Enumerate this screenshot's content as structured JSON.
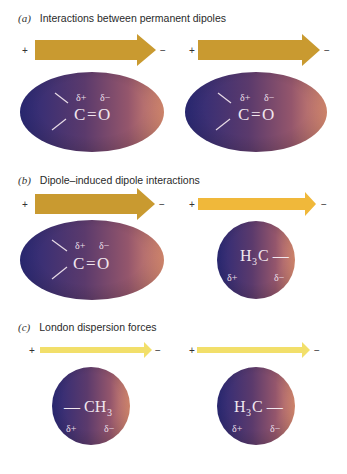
{
  "panels": [
    {
      "tag": "(a)",
      "title": "Interactions between permanent dipoles",
      "left": {
        "arrow": {
          "plus": "+",
          "minus": "−",
          "color": "#c99a30",
          "size": "large"
        },
        "molecule": {
          "shape": "ellipse",
          "formula_left": "C",
          "bond": "=",
          "formula_right": "O",
          "delta_plus": "δ+",
          "delta_minus": "δ−"
        }
      },
      "right": {
        "arrow": {
          "plus": "+",
          "minus": "−",
          "color": "#c99a30",
          "size": "large"
        },
        "molecule": {
          "shape": "ellipse",
          "formula_left": "C",
          "bond": "=",
          "formula_right": "O",
          "delta_plus": "δ+",
          "delta_minus": "δ−"
        }
      }
    },
    {
      "tag": "(b)",
      "title": "Dipole–induced dipole interactions",
      "left": {
        "arrow": {
          "plus": "+",
          "minus": "−",
          "color": "#c99a30",
          "size": "large"
        },
        "molecule": {
          "shape": "ellipse",
          "formula_left": "C",
          "bond": "=",
          "formula_right": "O",
          "delta_plus": "δ+",
          "delta_minus": "δ−"
        }
      },
      "right": {
        "arrow": {
          "plus": "+",
          "minus": "−",
          "color": "#f0b83a",
          "size": "medium"
        },
        "molecule": {
          "shape": "circle",
          "formula": "H",
          "sub": "3",
          "formula_tail": "C —",
          "delta_plus": "δ+",
          "delta_minus": "δ−"
        }
      }
    },
    {
      "tag": "(c)",
      "title": "London dispersion forces",
      "left": {
        "arrow": {
          "plus": "+",
          "minus": "−",
          "color": "#f2df6a",
          "size": "small"
        },
        "molecule": {
          "shape": "circle",
          "formula_head": "— CH",
          "sub": "3",
          "delta_plus": "δ+",
          "delta_minus": "δ−"
        }
      },
      "right": {
        "arrow": {
          "plus": "+",
          "minus": "−",
          "color": "#f2df6a",
          "size": "small"
        },
        "molecule": {
          "shape": "circle",
          "formula": "H",
          "sub": "3",
          "formula_tail": "C —",
          "delta_plus": "δ+",
          "delta_minus": "δ−"
        }
      }
    }
  ],
  "colors": {
    "molecule_left": "#2b2a78",
    "molecule_mid": "#6a3f6e",
    "molecule_right": "#d98a72"
  }
}
